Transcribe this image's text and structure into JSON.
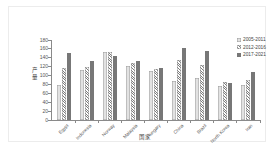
{
  "chart_data": {
    "type": "bar",
    "title": "",
    "xlabel": "国家",
    "ylabel": "产量",
    "categories": [
      "Egypt",
      "Indonesia",
      "Norway",
      "Malaysia",
      "Hungary",
      "China",
      "Brazil",
      "North Korea",
      "Iran"
    ],
    "series": [
      {
        "name": "2005-2011",
        "pattern": "dots",
        "color": "#e2e2e2",
        "values": [
          78,
          113,
          152,
          121,
          111,
          87,
          95,
          76,
          78
        ]
      },
      {
        "name": "2012-2016",
        "pattern": "diagonal-stripes",
        "color": "#ffffff",
        "values": [
          118,
          120,
          152,
          128,
          114,
          135,
          124,
          86,
          90
        ]
      },
      {
        "name": "2017-2021",
        "pattern": "solid",
        "color": "#777777",
        "values": [
          150,
          133,
          145,
          132,
          116,
          163,
          156,
          83,
          108
        ]
      }
    ],
    "ylim": [
      0,
      180
    ],
    "yticks": [
      0,
      20,
      40,
      60,
      80,
      100,
      120,
      140,
      160,
      180
    ],
    "grid": false,
    "legend_position": "top-right"
  }
}
